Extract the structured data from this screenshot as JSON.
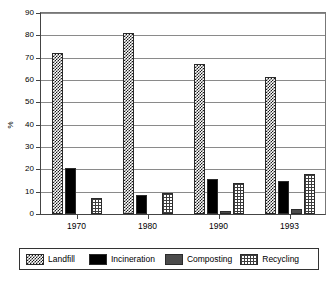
{
  "chart_data": {
    "type": "bar",
    "title": "",
    "xlabel": "",
    "ylabel": "%",
    "ylim": [
      0,
      90
    ],
    "yticks": [
      0,
      10,
      20,
      30,
      40,
      50,
      60,
      70,
      80,
      90
    ],
    "grid": true,
    "legend_position": "bottom",
    "categories": [
      "1970",
      "1980",
      "1990",
      "1993"
    ],
    "series": [
      {
        "name": "Landfill",
        "pattern": "dark-crosshatch",
        "color": "#1a1a1a",
        "values": [
          72,
          81,
          67,
          61.5
        ]
      },
      {
        "name": "Incineration",
        "pattern": "solid-black",
        "color": "#000000",
        "values": [
          20.5,
          8.5,
          15.5,
          15
        ]
      },
      {
        "name": "Composting",
        "pattern": "light-stipple",
        "color": "#4a4a4a",
        "values": [
          0,
          0,
          1.5,
          2.2
        ]
      },
      {
        "name": "Recycling",
        "pattern": "grid-mesh",
        "color": "#3d3d3d",
        "values": [
          7,
          9.5,
          14,
          17.8
        ]
      }
    ]
  },
  "axis": {
    "y_label": "%",
    "y_tick_labels": [
      "0",
      "10",
      "20",
      "30",
      "40",
      "50",
      "60",
      "70",
      "80",
      "90"
    ],
    "x_tick_labels": [
      "1970",
      "1980",
      "1990",
      "1993"
    ]
  },
  "legend": {
    "items": [
      {
        "label": "Landfill"
      },
      {
        "label": "Incineration"
      },
      {
        "label": "Composting"
      },
      {
        "label": "Recycling"
      }
    ]
  }
}
